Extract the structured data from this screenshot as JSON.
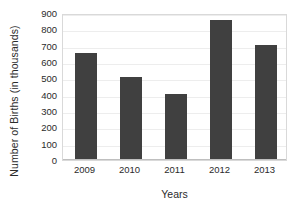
{
  "chart_data": {
    "type": "bar",
    "title": "",
    "subtitle": "",
    "xlabel": "Years",
    "ylabel": "Number of Births (in thousands)",
    "categories": [
      "2009",
      "2010",
      "2011",
      "2012",
      "2013"
    ],
    "values": [
      650,
      500,
      400,
      850,
      700
    ],
    "series": [
      {
        "name": "Number of Births",
        "values": [
          650,
          500,
          400,
          850,
          700
        ]
      }
    ],
    "ylim": [
      0,
      900
    ],
    "ytick_step": 100,
    "ytick_labels": [
      "900",
      "800",
      "700",
      "600",
      "500",
      "400",
      "300",
      "200",
      "100",
      "0"
    ],
    "ytick_values": [
      900,
      800,
      700,
      600,
      500,
      400,
      300,
      200,
      100,
      0
    ],
    "xtick_labels": [
      "2009",
      "2010",
      "2011",
      "2012",
      "2013"
    ],
    "grid": true,
    "grid_axis": "y",
    "legend": false,
    "legend_position": "none",
    "annotations": [],
    "colors": {
      "bar": "#404040",
      "gridline": "#ededed",
      "plot_border": "#d9d9d9",
      "axis_line": "#bfbfbf",
      "text": "#2b2b2b",
      "background": "#ffffff"
    }
  }
}
